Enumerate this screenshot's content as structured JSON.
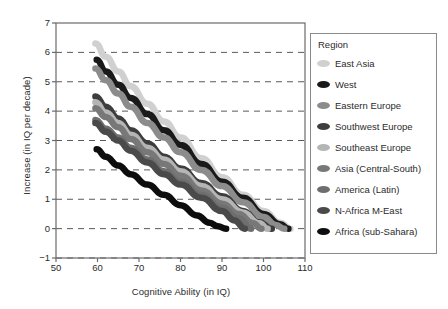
{
  "chart_data": {
    "type": "line",
    "title": "",
    "xlabel": "Cognitive Ability (in IQ)",
    "ylabel": "Increase (in IQ per decade)",
    "xlim": [
      50,
      110
    ],
    "ylim": [
      -1,
      7
    ],
    "xticks": [
      50,
      60,
      70,
      80,
      90,
      100,
      110
    ],
    "yticks": [
      -1,
      0,
      1,
      2,
      3,
      4,
      5,
      6,
      7
    ],
    "grid": "horizontal-dashed",
    "legend_position": "right-outside",
    "legend_title": "Region",
    "series": [
      {
        "name": "East Asia",
        "color": "#d0d0d0",
        "x": [
          59.5,
          62,
          65,
          68,
          72,
          76,
          80,
          85,
          90,
          95,
          100,
          104,
          106.5
        ],
        "y": [
          6.3,
          5.85,
          5.35,
          4.85,
          4.25,
          3.65,
          3.1,
          2.4,
          1.75,
          1.15,
          0.6,
          0.2,
          0.0
        ]
      },
      {
        "name": "West",
        "color": "#1a1a1a",
        "x": [
          59.8,
          62,
          65,
          68,
          72,
          76,
          80,
          85,
          90,
          95,
          100,
          104,
          106
        ],
        "y": [
          5.75,
          5.35,
          4.9,
          4.45,
          3.9,
          3.35,
          2.85,
          2.2,
          1.6,
          1.05,
          0.5,
          0.15,
          0.0
        ]
      },
      {
        "name": "Eastern Europe",
        "color": "#8c8c8c",
        "x": [
          59.5,
          62,
          65,
          68,
          72,
          76,
          80,
          85,
          90,
          95,
          100,
          103,
          105
        ],
        "y": [
          5.45,
          5.05,
          4.6,
          4.15,
          3.6,
          3.1,
          2.6,
          2.0,
          1.45,
          0.9,
          0.4,
          0.12,
          0.0
        ]
      },
      {
        "name": "Southwest Europe",
        "color": "#3d3d3d",
        "x": [
          59.5,
          62,
          65,
          68,
          72,
          76,
          80,
          85,
          90,
          95,
          99,
          102
        ],
        "y": [
          4.5,
          4.15,
          3.75,
          3.35,
          2.9,
          2.45,
          2.05,
          1.55,
          1.1,
          0.6,
          0.22,
          0.0
        ]
      },
      {
        "name": "Southeast Europe",
        "color": "#b5b5b5",
        "x": [
          59.5,
          62,
          65,
          68,
          72,
          76,
          80,
          85,
          90,
          95,
          99,
          101
        ],
        "y": [
          4.3,
          3.95,
          3.6,
          3.2,
          2.75,
          2.35,
          1.95,
          1.45,
          1.0,
          0.55,
          0.18,
          0.0
        ]
      },
      {
        "name": "Asia (Central-South)",
        "color": "#787878",
        "x": [
          59.5,
          62,
          65,
          68,
          72,
          76,
          80,
          85,
          90,
          94,
          97.5,
          99.5
        ],
        "y": [
          4.1,
          3.8,
          3.45,
          3.05,
          2.6,
          2.2,
          1.8,
          1.3,
          0.85,
          0.5,
          0.18,
          0.0
        ]
      },
      {
        "name": "America (Latin)",
        "color": "#6e6e6e",
        "x": [
          59.5,
          62,
          65,
          68,
          72,
          76,
          80,
          85,
          90,
          94,
          97
        ],
        "y": [
          3.7,
          3.4,
          3.1,
          2.75,
          2.35,
          1.95,
          1.6,
          1.15,
          0.7,
          0.35,
          0.0
        ]
      },
      {
        "name": "N-Africa M-East",
        "color": "#4a4a4a",
        "x": [
          59.5,
          62,
          65,
          68,
          72,
          76,
          80,
          85,
          90,
          93,
          95.5
        ],
        "y": [
          3.6,
          3.3,
          3.0,
          2.65,
          2.25,
          1.85,
          1.5,
          1.05,
          0.6,
          0.28,
          0.0
        ]
      },
      {
        "name": "Africa (sub-Sahara)",
        "color": "#0d0d0d",
        "x": [
          59.8,
          62,
          65,
          68,
          72,
          76,
          80,
          84,
          87,
          89,
          91
        ],
        "y": [
          2.7,
          2.45,
          2.15,
          1.85,
          1.5,
          1.15,
          0.8,
          0.45,
          0.2,
          0.08,
          0.0
        ]
      }
    ]
  },
  "legend": {
    "title": "Region",
    "items": [
      {
        "label": "East Asia",
        "color": "#d0d0d0"
      },
      {
        "label": "West",
        "color": "#1a1a1a"
      },
      {
        "label": "Eastern Europe",
        "color": "#8c8c8c"
      },
      {
        "label": "Southwest Europe",
        "color": "#3d3d3d"
      },
      {
        "label": "Southeast Europe",
        "color": "#b5b5b5"
      },
      {
        "label": "Asia (Central-South)",
        "color": "#787878"
      },
      {
        "label": "America (Latin)",
        "color": "#6e6e6e"
      },
      {
        "label": "N-Africa M-East",
        "color": "#4a4a4a"
      },
      {
        "label": "Africa (sub-Sahara)",
        "color": "#0d0d0d"
      }
    ]
  },
  "axes": {
    "x_title": "Cognitive Ability (in IQ)",
    "y_title": "Increase (in IQ per decade)",
    "x_tick_labels": [
      "50",
      "60",
      "70",
      "80",
      "90",
      "100",
      "110"
    ],
    "y_tick_labels": [
      "7",
      "6",
      "5",
      "4",
      "3",
      "2",
      "1",
      "0",
      "−1"
    ]
  }
}
